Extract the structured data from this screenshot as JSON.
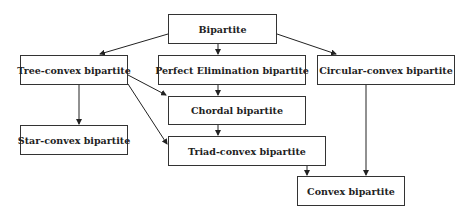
{
  "diagram": {
    "nodes": [
      {
        "id": "bipartite",
        "label": "Bipartite"
      },
      {
        "id": "tree_convex",
        "label": "Tree-convex bipartite"
      },
      {
        "id": "perfect_elimination",
        "label": "Perfect Elimination bipartite"
      },
      {
        "id": "circular_convex",
        "label": "Circular-convex bipartite"
      },
      {
        "id": "chordal",
        "label": "Chordal bipartite"
      },
      {
        "id": "star_convex",
        "label": "Star-convex bipartite"
      },
      {
        "id": "triad_convex",
        "label": "Triad-convex bipartite"
      },
      {
        "id": "convex",
        "label": "Convex bipartite"
      }
    ],
    "edges": [
      {
        "from": "bipartite",
        "to": "tree_convex"
      },
      {
        "from": "bipartite",
        "to": "perfect_elimination"
      },
      {
        "from": "bipartite",
        "to": "circular_convex"
      },
      {
        "from": "perfect_elimination",
        "to": "chordal"
      },
      {
        "from": "tree_convex",
        "to": "chordal"
      },
      {
        "from": "tree_convex",
        "to": "star_convex"
      },
      {
        "from": "tree_convex",
        "to": "triad_convex"
      },
      {
        "from": "chordal",
        "to": "triad_convex"
      },
      {
        "from": "triad_convex",
        "to": "convex"
      },
      {
        "from": "circular_convex",
        "to": "convex"
      }
    ]
  }
}
